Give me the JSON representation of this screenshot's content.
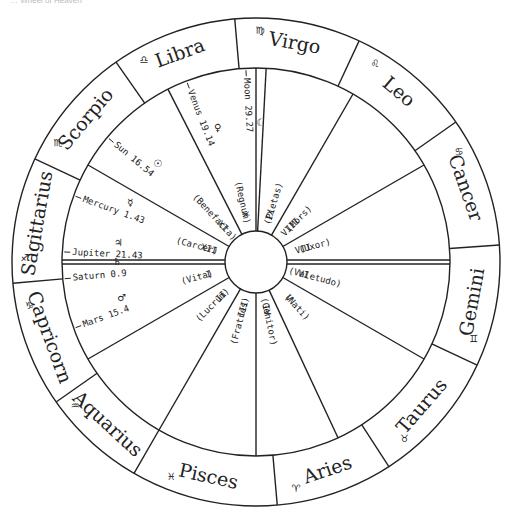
{
  "caption": "… Wheel of Heaven",
  "chart": {
    "center": [
      256,
      262
    ],
    "outer_radius": 244,
    "inner_radius": 194,
    "hub_radius": 31,
    "stroke_color": "#222222"
  },
  "signs": [
    {
      "name": "Virgo",
      "glyph": "♍",
      "start": 65,
      "end": 95
    },
    {
      "name": "Libra",
      "glyph": "♎",
      "start": 95,
      "end": 125
    },
    {
      "name": "Scorpio",
      "glyph": "♏",
      "start": 125,
      "end": 155
    },
    {
      "name": "Sagittarius",
      "glyph": "♐",
      "start": 155,
      "end": 185
    },
    {
      "name": "Capricorn",
      "glyph": "♑",
      "start": 185,
      "end": 215
    },
    {
      "name": "Aquarius",
      "glyph": "♒",
      "start": 215,
      "end": 240
    },
    {
      "name": "Pisces",
      "glyph": "♓",
      "start": 240,
      "end": 275
    },
    {
      "name": "Aries",
      "glyph": "♈",
      "start": 275,
      "end": 303
    },
    {
      "name": "Taurus",
      "glyph": "♉",
      "start": 303,
      "end": 335
    },
    {
      "name": "Gemini",
      "glyph": "♊",
      "start": 335,
      "end": 364
    },
    {
      "name": "Cancer",
      "glyph": "♋",
      "start": 4,
      "end": 35
    },
    {
      "name": "Leo",
      "glyph": "♌",
      "start": 35,
      "end": 65
    }
  ],
  "house_cusps": [
    0,
    30,
    60,
    87,
    90,
    117,
    150,
    180,
    210,
    240,
    270,
    295,
    330
  ],
  "houses": [
    {
      "numeral": "I",
      "name": "(Vita)"
    },
    {
      "numeral": "II",
      "name": "(Lucrum)"
    },
    {
      "numeral": "III",
      "name": "(Fratres)"
    },
    {
      "numeral": "IV",
      "name": "(Genitor)"
    },
    {
      "numeral": "V",
      "name": "(Nati)"
    },
    {
      "numeral": "VI",
      "name": "(Valetudo)"
    },
    {
      "numeral": "VII",
      "name": "(Uxor)"
    },
    {
      "numeral": "VIII",
      "name": "(Mors)"
    },
    {
      "numeral": "IX",
      "name": "(Pietas)"
    },
    {
      "numeral": "X",
      "name": "(Regnum)"
    },
    {
      "numeral": "XI",
      "name": "(Benefacta)"
    },
    {
      "numeral": "XII",
      "name": "(Carcer)"
    }
  ],
  "planets": [
    {
      "name": "Moon",
      "glyph": "☾",
      "position": "29.27"
    },
    {
      "name": "Venus",
      "glyph": "♀",
      "position": "19.14"
    },
    {
      "name": "Sun",
      "glyph": "☉",
      "position": "16.54"
    },
    {
      "name": "Mercury",
      "glyph": "☿",
      "position": "1.43"
    },
    {
      "name": "Jupiter",
      "glyph": "♃",
      "position": "21.43"
    },
    {
      "name": "Saturn",
      "glyph": "♄",
      "position": "0.9"
    },
    {
      "name": "Mars",
      "glyph": "♂",
      "position": "15.4"
    }
  ]
}
